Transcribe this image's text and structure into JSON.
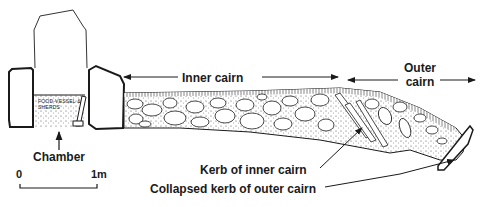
{
  "diagram": {
    "labels": {
      "inner_cairn": "Inner cairn",
      "outer_cairn_line1": "Outer",
      "outer_cairn_line2": "cairn",
      "chamber": "Chamber",
      "kerb_inner": "Kerb of inner cairn",
      "collapsed_kerb_outer": "Collapsed kerb of outer cairn",
      "chamber_contents_line1": "FOOD-VESSEL &",
      "chamber_contents_line2": "SHERDS"
    },
    "scale_bar": {
      "start_label": "0",
      "end_label": "1m"
    },
    "colors": {
      "line": "#1a1a1a",
      "fill": "#ffffff",
      "background": "#ffffff"
    }
  }
}
